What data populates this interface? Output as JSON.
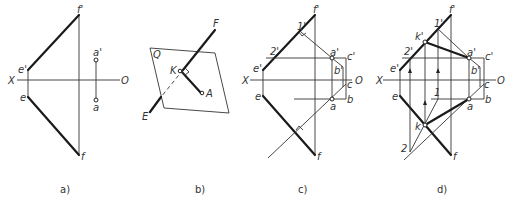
{
  "figure": {
    "panels": [
      {
        "id": "a",
        "caption": "a)",
        "labels": {
          "f_prime": "f'",
          "a_prime": "a'",
          "X": "X",
          "O": "O",
          "e_prime": "e'",
          "e": "e",
          "a": "a",
          "f": "f"
        }
      },
      {
        "id": "b",
        "caption": "b)",
        "labels": {
          "F": "F",
          "Q": "Q",
          "K": "K",
          "A": "A",
          "E": "E"
        }
      },
      {
        "id": "c",
        "caption": "c)",
        "labels": {
          "f_prime": "f'",
          "one_prime": "1'",
          "two_prime": "2'",
          "a_prime": "a'",
          "c_prime": "c'",
          "e_prime": "e'",
          "b_prime": "b'",
          "X": "X",
          "O": "O",
          "c": "c",
          "e": "e",
          "a": "a",
          "b": "b",
          "f": "f"
        }
      },
      {
        "id": "d",
        "caption": "d)",
        "labels": {
          "f_prime": "f'",
          "one_prime": "1'",
          "k_prime": "k'",
          "two_prime": "2'",
          "a_prime": "a'",
          "c_prime": "c'",
          "e_prime": "e'",
          "b_prime": "b'",
          "X": "X",
          "O": "O",
          "c": "c",
          "e": "e",
          "one": "1",
          "b": "b",
          "a": "a",
          "k": "k",
          "two": "2",
          "f": "f"
        }
      }
    ]
  }
}
